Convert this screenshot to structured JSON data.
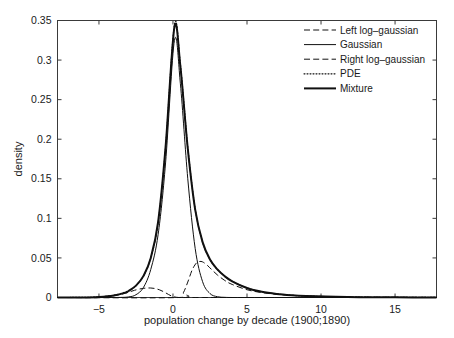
{
  "chart_data": {
    "type": "line",
    "title": "",
    "xlabel": "population change by decade (1900;1890)",
    "ylabel": "density",
    "xlim": [
      -7.8,
      17.8
    ],
    "ylim": [
      0,
      0.35
    ],
    "xticks": [
      -5,
      0,
      5,
      10,
      15
    ],
    "xticklabels": [
      "−5",
      "0",
      "5",
      "10",
      "15"
    ],
    "yticks": [
      0,
      0.05,
      0.1,
      0.15,
      0.2,
      0.25,
      0.3,
      0.35
    ],
    "yticklabels": [
      "0",
      "0.05",
      "0.1",
      "0.15",
      "0.2",
      "0.25",
      "0.3",
      "0.35"
    ],
    "grid": false,
    "legend_position": "top-right",
    "series": [
      {
        "name": "Left log-gaussian",
        "style": "dashed",
        "linewidth": 1,
        "color": "#101010",
        "model": "reflected-lognormal",
        "weight": 0.1,
        "location": -1.6,
        "shape": 0.62,
        "scale": 1.25,
        "peak_x": -1.5,
        "peak_y": 0.012,
        "x": [
          -7.8,
          -6.0,
          -5.0,
          -4.0,
          -3.2,
          -2.6,
          -2.1,
          -1.8,
          -1.5,
          -1.2,
          -0.9,
          -0.6,
          -0.3,
          0.0,
          0.4,
          1.0,
          2.0,
          4.0,
          8.0,
          17.8
        ],
        "y": [
          0.0,
          0.0,
          0.0005,
          0.0022,
          0.0055,
          0.0091,
          0.0113,
          0.0119,
          0.012,
          0.0113,
          0.0096,
          0.007,
          0.0038,
          0.0012,
          0.0,
          0.0,
          0.0,
          0.0,
          0.0,
          0.0
        ]
      },
      {
        "name": "Gaussian",
        "style": "solid",
        "linewidth": 1,
        "color": "#101010",
        "model": "normal",
        "weight": 0.62,
        "mean": 0.1,
        "sigma": 0.76,
        "peak_x": 0.1,
        "peak_y": 0.325,
        "x": [
          -7.8,
          -4.0,
          -3.0,
          -2.5,
          -2.0,
          -1.5,
          -1.0,
          -0.5,
          0.1,
          0.5,
          1.0,
          1.5,
          2.0,
          2.5,
          3.0,
          3.5,
          4.0,
          5.0,
          17.8
        ],
        "y": [
          0.0,
          0.0,
          0.0008,
          0.0035,
          0.0125,
          0.0355,
          0.08,
          0.17,
          0.325,
          0.27,
          0.15,
          0.062,
          0.02,
          0.005,
          0.001,
          0.0002,
          0.0,
          0.0,
          0.0
        ]
      },
      {
        "name": "Right  log-gaussian",
        "style": "dashed",
        "linewidth": 1,
        "color": "#101010",
        "model": "lognormal",
        "weight": 0.28,
        "location": 0.6,
        "shape": 0.7,
        "scale": 1.6,
        "peak_x": 1.8,
        "peak_y": 0.0455,
        "x": [
          -7.8,
          0.4,
          0.7,
          1.0,
          1.3,
          1.6,
          1.8,
          2.0,
          2.3,
          2.6,
          3.0,
          3.5,
          4.0,
          5.0,
          6.0,
          7.0,
          8.0,
          10.0,
          13.0,
          17.8
        ],
        "y": [
          0.0,
          0.0,
          0.006,
          0.0195,
          0.035,
          0.044,
          0.0455,
          0.045,
          0.041,
          0.0355,
          0.0285,
          0.0215,
          0.0165,
          0.0098,
          0.0062,
          0.0041,
          0.0028,
          0.0014,
          0.0005,
          0.0002
        ]
      },
      {
        "name": "PDE",
        "style": "dotted",
        "linewidth": 1.15,
        "color": "#101010",
        "peak_x": 0.1,
        "peak_y": 0.345,
        "x": [
          -7.8,
          -6.0,
          -5.0,
          -4.0,
          -3.0,
          -2.5,
          -2.0,
          -1.5,
          -1.0,
          -0.5,
          0.1,
          0.5,
          1.0,
          1.5,
          2.0,
          2.5,
          3.0,
          3.5,
          4.0,
          5.0,
          6.0,
          7.0,
          8.0,
          9.0,
          11.0,
          13.0,
          15.0,
          17.8
        ],
        "y": [
          0.0,
          0.0002,
          0.0008,
          0.0028,
          0.0085,
          0.015,
          0.027,
          0.05,
          0.095,
          0.19,
          0.345,
          0.295,
          0.19,
          0.112,
          0.07,
          0.048,
          0.0355,
          0.027,
          0.0205,
          0.012,
          0.0072,
          0.0045,
          0.0028,
          0.0018,
          0.0008,
          0.0004,
          0.0002,
          0.0001
        ]
      },
      {
        "name": "Mixture",
        "style": "solid",
        "linewidth": 2,
        "color": "#101010",
        "peak_x": 0.1,
        "peak_y": 0.342,
        "x": [
          -7.8,
          -6.0,
          -5.0,
          -4.0,
          -3.2,
          -3.0,
          -2.5,
          -2.0,
          -1.5,
          -1.0,
          -0.5,
          0.1,
          0.5,
          1.0,
          1.5,
          2.0,
          2.5,
          3.0,
          3.5,
          4.0,
          5.0,
          6.0,
          7.0,
          8.0,
          9.0,
          11.0,
          13.0,
          15.0,
          17.8
        ],
        "y": [
          0.0,
          0.0001,
          0.0006,
          0.0025,
          0.0062,
          0.0082,
          0.015,
          0.027,
          0.05,
          0.096,
          0.19,
          0.342,
          0.292,
          0.188,
          0.111,
          0.07,
          0.048,
          0.0355,
          0.0268,
          0.0205,
          0.012,
          0.0072,
          0.0045,
          0.0029,
          0.0019,
          0.0008,
          0.0004,
          0.0002,
          0.0001
        ]
      }
    ]
  },
  "axes": {
    "ylabel": "density",
    "xlabel": "population change by decade (1900;1890)",
    "xtick_labels": [
      "−5",
      "0",
      "5",
      "10",
      "15"
    ],
    "ytick_labels": [
      "0",
      "0.05",
      "0.1",
      "0.15",
      "0.2",
      "0.25",
      "0.3",
      "0.35"
    ]
  },
  "legend": {
    "items": [
      {
        "label": "Left log–gaussian",
        "style": "dashed"
      },
      {
        "label": "Gaussian",
        "style": "solid-thin"
      },
      {
        "label": "Right  log–gaussian",
        "style": "dashed"
      },
      {
        "label": "PDE",
        "style": "dotted"
      },
      {
        "label": "Mixture",
        "style": "solid-thick"
      }
    ]
  }
}
